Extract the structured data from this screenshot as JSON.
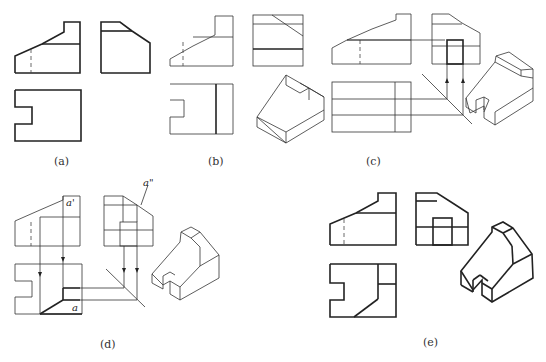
{
  "figure": {
    "panels": [
      {
        "id": "a",
        "caption": "(a)"
      },
      {
        "id": "b",
        "caption": "(b)"
      },
      {
        "id": "c",
        "caption": "(c)"
      },
      {
        "id": "d",
        "caption": "(d)",
        "annotations": {
          "front_point": "a'",
          "side_point": "a\"",
          "top_point": "a"
        }
      },
      {
        "id": "e",
        "caption": "(e)"
      }
    ]
  }
}
